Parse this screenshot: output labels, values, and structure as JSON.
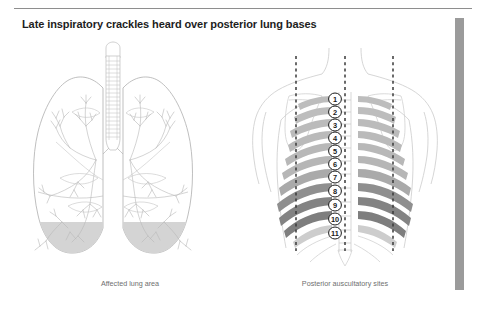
{
  "document": {
    "title": "Late inspiratory crackles heard over posterior lung bases",
    "background_color": "#ffffff",
    "rule_color": "#8e8e8e",
    "edge_bar_color": "#9b9b9b"
  },
  "panels": {
    "left": {
      "caption": "Affected lung area",
      "name": "anterior-lung-diagram",
      "parts": {
        "trachea": "trachea",
        "left_lung": "left-lung",
        "right_lung": "right-lung",
        "bronchial_tree": "bronchial-tree",
        "affected_base_fill": "#d4d4d4",
        "diaphragm_fill": "#8d8d8d",
        "outline_color": "#b4b4b4"
      }
    },
    "right": {
      "caption": "Posterior auscultatory sites",
      "name": "posterior-torso-diagram",
      "parts": {
        "torso_outline_color": "#cfcfcf",
        "scapula_color": "#d0d0d0",
        "spine_color": "#c6c6c6",
        "dashed_line_color": "#3a3a3a"
      },
      "auscultatory_sites": [
        {
          "number": "1",
          "rib_shade": "#bdbdbd"
        },
        {
          "number": "2",
          "rib_shade": "#bdbdbd"
        },
        {
          "number": "3",
          "rib_shade": "#bbbbbb"
        },
        {
          "number": "4",
          "rib_shade": "#bababa"
        },
        {
          "number": "5",
          "rib_shade": "#b8b8b8"
        },
        {
          "number": "6",
          "rib_shade": "#b6b6b6"
        },
        {
          "number": "7",
          "rib_shade": "#aaaaaa"
        },
        {
          "number": "8",
          "rib_shade": "#8f8f8f"
        },
        {
          "number": "9",
          "rib_shade": "#838383"
        },
        {
          "number": "10",
          "rib_shade": "#7e7e7e"
        },
        {
          "number": "11",
          "rib_shade": "#cdcdcd"
        }
      ],
      "dashed_lines": [
        {
          "name": "left-scapular-line",
          "x": 296
        },
        {
          "name": "vertebral-midline",
          "x": 345
        },
        {
          "name": "right-scapular-line",
          "x": 393
        }
      ]
    }
  }
}
